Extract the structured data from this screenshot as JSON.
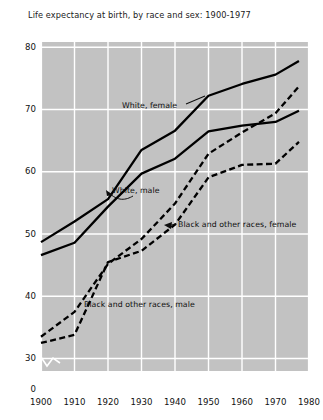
{
  "chart_data": {
    "type": "line",
    "title": "Life expectancy at birth, by race and sex: 1900-1977",
    "xlabel": "",
    "ylabel": "",
    "xlim": [
      1900,
      1980
    ],
    "ylim": [
      28,
      81
    ],
    "y_axis_break": true,
    "y_break_label": "0",
    "grid": true,
    "grid_color": "#ffffff",
    "plot_background": "#c2c2c2",
    "legend_position": "inline-annotations",
    "xticks": [
      1900,
      1910,
      1920,
      1930,
      1940,
      1950,
      1960,
      1970,
      1980
    ],
    "xtick_labels": [
      "1900",
      "1910",
      "1920",
      "1930",
      "1940",
      "1950",
      "1960",
      "1970",
      "1980"
    ],
    "yticks": [
      30,
      40,
      50,
      60,
      70,
      80
    ],
    "ytick_labels": [
      "30",
      "40",
      "50",
      "60",
      "70",
      "80"
    ],
    "series": [
      {
        "name": "White, female",
        "style": "solid",
        "color": "#000000",
        "x": [
          1900,
          1910,
          1920,
          1930,
          1940,
          1950,
          1960,
          1970,
          1977
        ],
        "values": [
          48.7,
          52.0,
          55.6,
          63.5,
          66.6,
          72.2,
          74.1,
          75.6,
          77.8
        ]
      },
      {
        "name": "White, male",
        "style": "solid",
        "color": "#000000",
        "x": [
          1900,
          1910,
          1920,
          1930,
          1940,
          1950,
          1960,
          1970,
          1977
        ],
        "values": [
          46.6,
          48.6,
          54.4,
          59.7,
          62.1,
          66.5,
          67.4,
          68.0,
          69.8
        ]
      },
      {
        "name": "Black and other races, female",
        "style": "dashed",
        "color": "#000000",
        "x": [
          1900,
          1910,
          1920,
          1930,
          1940,
          1950,
          1960,
          1970,
          1977
        ],
        "values": [
          33.5,
          37.5,
          45.2,
          49.2,
          54.9,
          62.9,
          66.3,
          69.4,
          73.7
        ]
      },
      {
        "name": "Black and other races, male",
        "style": "dashed",
        "color": "#000000",
        "x": [
          1900,
          1910,
          1920,
          1930,
          1940,
          1950,
          1960,
          1970,
          1977
        ],
        "values": [
          32.5,
          33.8,
          45.5,
          47.3,
          51.5,
          59.1,
          61.1,
          61.3,
          64.8
        ]
      }
    ],
    "annotations": [
      {
        "text": "White, female",
        "x_px": 122,
        "y_px": 101,
        "has_pointer": true
      },
      {
        "text": "White, male",
        "x_px": 112,
        "y_px": 186,
        "has_pointer": true
      },
      {
        "text": "Black and other races, female",
        "x_px": 178,
        "y_px": 220,
        "has_pointer": true
      },
      {
        "text": "Black and other races, male",
        "x_px": 84,
        "y_px": 300,
        "has_pointer": false
      }
    ]
  }
}
